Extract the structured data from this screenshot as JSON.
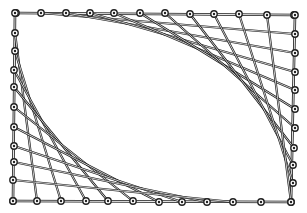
{
  "figure": {
    "type": "string-art",
    "colors": {
      "background": "#ffffff",
      "line": "#1a1a1a",
      "nail": "#222222"
    },
    "nails": {
      "top": [
        [
          16,
          13
        ],
        [
          41,
          13
        ],
        [
          66,
          13
        ],
        [
          90,
          13
        ],
        [
          114,
          13
        ],
        [
          140,
          13
        ],
        [
          165,
          13
        ],
        [
          190,
          14
        ],
        [
          214,
          14
        ],
        [
          239,
          14
        ],
        [
          267,
          15
        ],
        [
          294,
          15
        ]
      ],
      "right": [
        [
          295,
          15
        ],
        [
          295,
          34
        ],
        [
          295,
          53
        ],
        [
          295,
          72
        ],
        [
          295,
          90
        ],
        [
          295,
          109
        ],
        [
          295,
          128
        ],
        [
          294,
          148
        ],
        [
          293,
          165
        ],
        [
          293,
          183
        ],
        [
          291,
          202
        ]
      ],
      "left": [
        [
          15,
          13
        ],
        [
          15,
          33
        ],
        [
          15,
          51
        ],
        [
          14,
          70
        ],
        [
          14,
          87
        ],
        [
          14,
          107
        ],
        [
          14,
          127
        ],
        [
          14,
          146
        ],
        [
          14,
          162
        ],
        [
          13,
          180
        ],
        [
          13,
          201
        ]
      ],
      "bottom": [
        [
          13,
          201
        ],
        [
          37,
          201
        ],
        [
          61,
          201
        ],
        [
          86,
          201
        ],
        [
          108,
          201
        ],
        [
          133,
          201
        ],
        [
          159,
          202
        ],
        [
          182,
          202
        ],
        [
          207,
          202
        ],
        [
          233,
          202
        ],
        [
          261,
          202
        ],
        [
          291,
          202
        ]
      ]
    }
  }
}
